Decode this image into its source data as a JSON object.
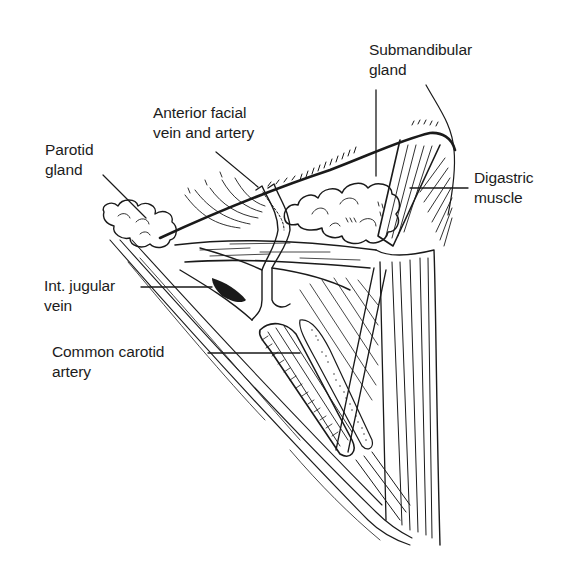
{
  "figure": {
    "ink_color": "#1a1a1a",
    "background": "#ffffff"
  },
  "labels": {
    "submandibular_gland": [
      "Submandibular",
      "gland"
    ],
    "anterior_facial": [
      "Anterior facial",
      "vein and artery"
    ],
    "parotid_gland": [
      "Parotid",
      "gland"
    ],
    "digastric_muscle": [
      "Digastric",
      "muscle"
    ],
    "int_jugular_vein": [
      "Int. jugular",
      "vein"
    ],
    "common_carotid_artery": [
      "Common carotid",
      "artery"
    ]
  }
}
